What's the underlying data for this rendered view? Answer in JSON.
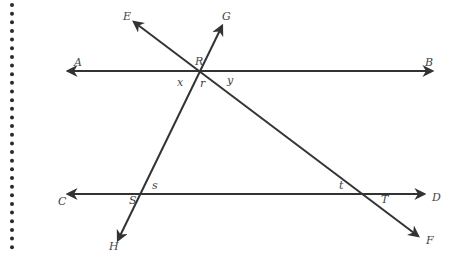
{
  "diagram": {
    "type": "geometry-lines-transversals",
    "lines": [
      {
        "name": "AB",
        "from": "A",
        "to": "B",
        "x1": 68,
        "y1": 71,
        "x2": 432,
        "y2": 71
      },
      {
        "name": "CD",
        "from": "C",
        "to": "D",
        "x1": 68,
        "y1": 194,
        "x2": 424,
        "y2": 194
      },
      {
        "name": "EF",
        "from": "E",
        "to": "F",
        "x1": 134,
        "y1": 22,
        "x2": 418,
        "y2": 236
      },
      {
        "name": "GH",
        "from": "G",
        "to": "H",
        "x1": 222,
        "y1": 26,
        "x2": 118,
        "y2": 240
      }
    ],
    "points": [
      {
        "label": "A",
        "x": 74,
        "y": 66
      },
      {
        "label": "B",
        "x": 425,
        "y": 66
      },
      {
        "label": "C",
        "x": 58,
        "y": 205
      },
      {
        "label": "D",
        "x": 432,
        "y": 201
      },
      {
        "label": "E",
        "x": 123,
        "y": 20
      },
      {
        "label": "F",
        "x": 426,
        "y": 244
      },
      {
        "label": "G",
        "x": 222,
        "y": 20
      },
      {
        "label": "H",
        "x": 109,
        "y": 250
      },
      {
        "label": "R",
        "x": 195,
        "y": 65
      },
      {
        "label": "S",
        "x": 129,
        "y": 204
      },
      {
        "label": "T",
        "x": 381,
        "y": 203
      }
    ],
    "angle_labels": [
      {
        "label": "x",
        "x": 177,
        "y": 86
      },
      {
        "label": "r",
        "x": 200,
        "y": 87
      },
      {
        "label": "y",
        "x": 227,
        "y": 84
      },
      {
        "label": "s",
        "x": 152,
        "y": 189
      },
      {
        "label": "t",
        "x": 339,
        "y": 189
      }
    ],
    "margin_dots": {
      "count": 29,
      "x": 12,
      "start_y": 5,
      "spacing": 8.65
    }
  }
}
